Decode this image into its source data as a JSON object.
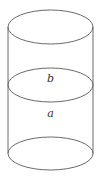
{
  "diagram": {
    "labels": {
      "upper": "b",
      "lower": "a"
    },
    "colors": {
      "stroke": "#6a6a6a",
      "text": "#333333",
      "background": "#ffffff"
    }
  }
}
